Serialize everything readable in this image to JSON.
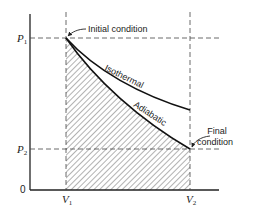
{
  "diagram": {
    "type": "pressure-volume diagram",
    "axes": {
      "origin_label": "0",
      "y_ticks": [
        {
          "main": "P",
          "sub": "1"
        },
        {
          "main": "P",
          "sub": "2"
        }
      ],
      "x_ticks": [
        {
          "main": "V",
          "sub": "1"
        },
        {
          "main": "V",
          "sub": "2"
        }
      ]
    },
    "curves": [
      {
        "name": "isothermal",
        "label": "Isothermal"
      },
      {
        "name": "adiabatic",
        "label": "Adiabatic"
      }
    ],
    "annotations": {
      "initial": "Initial condition",
      "final_line1": "Final",
      "final_line2": "condition"
    },
    "shaded_region": "area under adiabatic curve between V1 and V2"
  }
}
